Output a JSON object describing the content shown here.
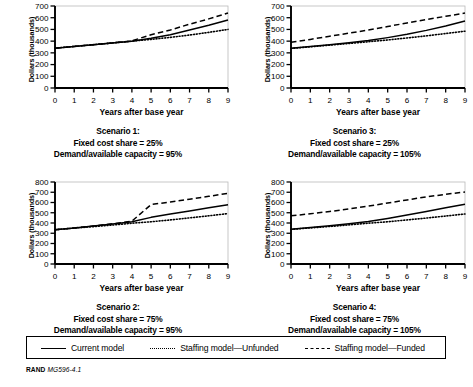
{
  "figure": {
    "footer_source": "RAND",
    "footer_code": "MG596-4.1"
  },
  "legend": {
    "items": [
      {
        "label": "Current model",
        "style": "solid"
      },
      {
        "label": "Staffing model—Unfunded",
        "style": "dotted"
      },
      {
        "label": "Staffing model—Funded",
        "style": "dashed"
      }
    ]
  },
  "panels": [
    {
      "caption_line1": "Scenario 1:",
      "caption_line2": "Fixed cost share = 25%",
      "caption_line3": "Demand/available capacity = 95%",
      "ylabel": "Dollars (thousands)",
      "xlabel": "Years after base year"
    },
    {
      "caption_line1": "Scenario 3:",
      "caption_line2": "Fixed cost share = 25%",
      "caption_line3": "Demand/available capacity = 105%",
      "ylabel": "Dollars (thousands)",
      "xlabel": "Years after base year"
    },
    {
      "caption_line1": "Scenario 2:",
      "caption_line2": "Fixed cost share = 75%",
      "caption_line3": "Demand/available capacity = 95%",
      "ylabel": "Dollars (thousands)",
      "xlabel": "Years after base year"
    },
    {
      "caption_line1": "Scenario 4:",
      "caption_line2": "Fixed cost share = 75%",
      "caption_line3": "Demand/available capacity = 105%",
      "ylabel": "Dollars (thousands)",
      "xlabel": "Years after base year"
    }
  ],
  "chart_data": [
    {
      "type": "line",
      "title": "Scenario 1: Fixed cost share = 25%, Demand/available capacity = 95%",
      "xlabel": "Years after base year",
      "ylabel": "Dollars (thousands)",
      "xlim": [
        0,
        9
      ],
      "ylim": [
        0,
        700
      ],
      "xticks": [
        0,
        1,
        2,
        3,
        4,
        5,
        6,
        7,
        8,
        9
      ],
      "yticks": [
        0,
        100,
        200,
        300,
        400,
        500,
        600,
        700
      ],
      "grid": false,
      "legend_position": "below-figure-shared",
      "x": [
        0,
        1,
        2,
        3,
        4,
        5,
        6,
        7,
        8,
        9
      ],
      "series": [
        {
          "name": "Current model",
          "style": "solid",
          "values": [
            340,
            355,
            370,
            385,
            400,
            425,
            455,
            495,
            535,
            580
          ]
        },
        {
          "name": "Staffing model—Unfunded",
          "style": "dotted",
          "values": [
            340,
            355,
            370,
            385,
            400,
            415,
            432,
            452,
            475,
            500
          ]
        },
        {
          "name": "Staffing model—Funded",
          "style": "dashed",
          "values": [
            340,
            355,
            370,
            385,
            402,
            455,
            495,
            545,
            590,
            640
          ]
        }
      ]
    },
    {
      "type": "line",
      "title": "Scenario 3: Fixed cost share = 25%, Demand/available capacity = 105%",
      "xlabel": "Years after base year",
      "ylabel": "Dollars (thousands)",
      "xlim": [
        0,
        9
      ],
      "ylim": [
        0,
        700
      ],
      "xticks": [
        0,
        1,
        2,
        3,
        4,
        5,
        6,
        7,
        8,
        9
      ],
      "yticks": [
        0,
        100,
        200,
        300,
        400,
        500,
        600,
        700
      ],
      "grid": false,
      "legend_position": "below-figure-shared",
      "x": [
        0,
        1,
        2,
        3,
        4,
        5,
        6,
        7,
        8,
        9
      ],
      "series": [
        {
          "name": "Current model",
          "style": "solid",
          "values": [
            340,
            355,
            370,
            387,
            405,
            430,
            458,
            492,
            530,
            572
          ]
        },
        {
          "name": "Staffing model—Unfunded",
          "style": "dotted",
          "values": [
            338,
            352,
            366,
            380,
            395,
            410,
            427,
            445,
            465,
            485
          ]
        },
        {
          "name": "Staffing model—Funded",
          "style": "dashed",
          "values": [
            390,
            415,
            442,
            468,
            495,
            525,
            555,
            585,
            612,
            640
          ]
        }
      ]
    },
    {
      "type": "line",
      "title": "Scenario 2: Fixed cost share = 75%, Demand/available capacity = 95%",
      "xlabel": "Years after base year",
      "ylabel": "Dollars (thousands)",
      "xlim": [
        0,
        9
      ],
      "ylim": [
        0,
        800
      ],
      "xticks": [
        0,
        1,
        2,
        3,
        4,
        5,
        6,
        7,
        8,
        9
      ],
      "yticks": [
        0,
        100,
        200,
        300,
        400,
        500,
        600,
        700,
        800
      ],
      "grid": false,
      "legend_position": "below-figure-shared",
      "x": [
        0,
        1,
        2,
        3,
        4,
        5,
        6,
        7,
        8,
        9
      ],
      "series": [
        {
          "name": "Current model",
          "style": "solid",
          "values": [
            335,
            352,
            370,
            390,
            412,
            455,
            488,
            518,
            548,
            578
          ]
        },
        {
          "name": "Staffing model—Unfunded",
          "style": "dotted",
          "values": [
            335,
            350,
            365,
            380,
            398,
            412,
            430,
            450,
            470,
            492
          ]
        },
        {
          "name": "Staffing model—Funded",
          "style": "dashed",
          "values": [
            335,
            352,
            370,
            392,
            418,
            580,
            605,
            632,
            660,
            690
          ]
        }
      ]
    },
    {
      "type": "line",
      "title": "Scenario 4: Fixed cost share = 75%, Demand/available capacity = 105%",
      "xlabel": "Years after base year",
      "ylabel": "Dollars (thousands)",
      "xlim": [
        0,
        9
      ],
      "ylim": [
        0,
        800
      ],
      "xticks": [
        0,
        1,
        2,
        3,
        4,
        5,
        6,
        7,
        8,
        9
      ],
      "yticks": [
        0,
        100,
        200,
        300,
        400,
        500,
        600,
        700,
        800
      ],
      "grid": false,
      "legend_position": "below-figure-shared",
      "x": [
        0,
        1,
        2,
        3,
        4,
        5,
        6,
        7,
        8,
        9
      ],
      "series": [
        {
          "name": "Current model",
          "style": "solid",
          "values": [
            340,
            355,
            372,
            392,
            415,
            445,
            478,
            512,
            548,
            582
          ]
        },
        {
          "name": "Staffing model—Unfunded",
          "style": "dotted",
          "values": [
            338,
            352,
            366,
            382,
            398,
            412,
            430,
            448,
            468,
            488
          ]
        },
        {
          "name": "Staffing model—Funded",
          "style": "dashed",
          "values": [
            470,
            490,
            512,
            538,
            565,
            595,
            625,
            655,
            680,
            702
          ]
        }
      ]
    }
  ]
}
